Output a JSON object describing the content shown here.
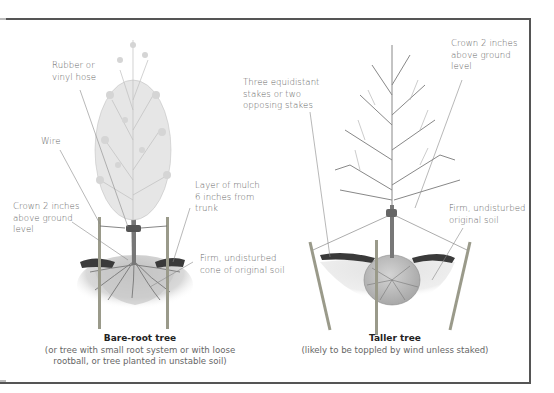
{
  "diagram": {
    "panels": [
      {
        "id": "bare-root",
        "title": "Bare-root tree",
        "subtitle_line1": "(or tree with small root system or with loose",
        "subtitle_line2": "rootball, or tree planted in unstable soil)",
        "labels": {
          "hose_line1": "Rubber or",
          "hose_line2": "vinyl hose",
          "wire": "Wire",
          "crown_line1": "Crown 2 inches",
          "crown_line2": "above ground",
          "crown_line3": "level",
          "mulch_line1": "Layer of mulch",
          "mulch_line2": "6 inches from",
          "mulch_line3": "trunk",
          "soil_line1": "Firm, undisturbed",
          "soil_line2": "cone of original soil"
        }
      },
      {
        "id": "taller",
        "title": "Taller tree",
        "subtitle_line1": "(likely to be toppled by wind unless staked)",
        "labels": {
          "stakes_line1": "Three equidistant",
          "stakes_line2": "stakes or two",
          "stakes_line3": "opposing stakes",
          "crown_line1": "Crown 2 inches",
          "crown_line2": "above ground",
          "crown_line3": "level",
          "soil_line1": "Firm, undisturbed",
          "soil_line2": "original soil"
        }
      }
    ],
    "colors": {
      "frame": "#555555",
      "label_text": "#666666",
      "title_text": "#222222",
      "leader_line": "#888888",
      "mulch": "#3a3a3a",
      "stake": "#9a9a8a"
    }
  }
}
